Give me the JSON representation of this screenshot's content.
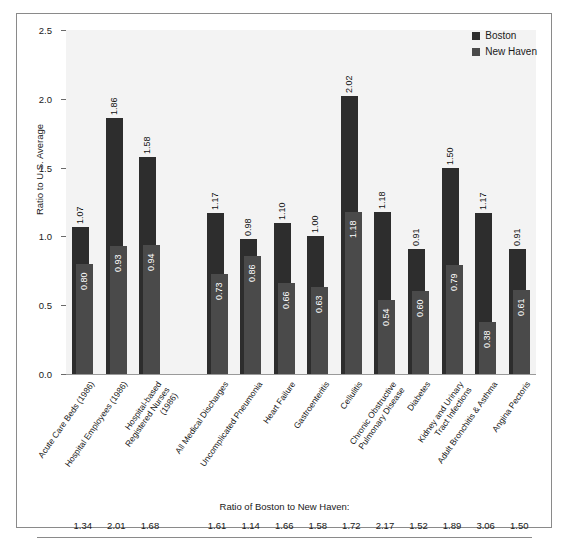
{
  "figure": {
    "y_axis_title": "Ratio to U.S. Average",
    "ratio_row_title": "Ratio of Boston to New Haven:"
  },
  "legend": {
    "position": "top-right",
    "entries": [
      {
        "label": "Boston",
        "color": "#2d2d2d"
      },
      {
        "label": "New Haven",
        "color": "#4a4a4a"
      }
    ]
  },
  "chart_data": {
    "type": "bar",
    "title": "",
    "xlabel": "",
    "ylabel": "Ratio to U.S. Average",
    "ylim": [
      0.0,
      2.5
    ],
    "yticks": [
      "0.0",
      "0.5",
      "1.0",
      "1.5",
      "2.0",
      "2.5"
    ],
    "grid": false,
    "legend_position": "top-right",
    "group_gap_after_index": 2,
    "categories": [
      "Acute Care Beds (1986)",
      "Hospital Employees (1986)",
      "Hospital-based Registered Nurses (1986)",
      "All Medical Discharges",
      "Uncomplicated Pneumonia",
      "Heart Failure",
      "Gastroenteritis",
      "Cellulitis",
      "Chronic Obstructive Pulmonary Disease",
      "Diabetes",
      "Kidney and Urinary Tract Infections",
      "Adult Bronchitis & Asthma",
      "Angina Pectoris"
    ],
    "series": [
      {
        "name": "Boston",
        "color": "#2d2d2d",
        "values": [
          1.07,
          1.86,
          1.58,
          1.17,
          0.98,
          1.1,
          1.0,
          2.02,
          1.18,
          0.91,
          1.5,
          1.17,
          0.91
        ]
      },
      {
        "name": "New Haven",
        "color": "#4a4a4a",
        "values": [
          0.8,
          0.93,
          0.94,
          0.73,
          0.86,
          0.66,
          0.63,
          1.18,
          0.54,
          0.6,
          0.79,
          0.38,
          0.61
        ]
      }
    ],
    "ratio_boston_to_new_haven": [
      1.34,
      2.01,
      1.68,
      1.61,
      1.14,
      1.66,
      1.58,
      1.72,
      2.17,
      1.52,
      1.89,
      3.06,
      1.5
    ]
  }
}
